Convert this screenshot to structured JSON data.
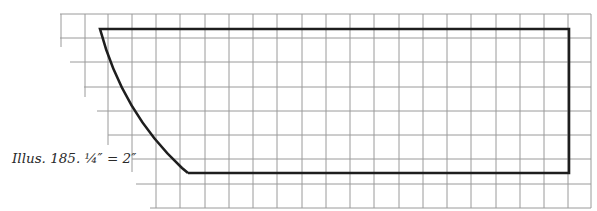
{
  "caption": {
    "text": "Illus. 185. ¼″ = 2″",
    "label": "Illus. 185.",
    "scale": "¼″ = 2″"
  },
  "grid": {
    "color": "#9a9a9a",
    "cell_px": 24.3,
    "right_x": 591,
    "bottom_y": 208,
    "rows": [
      {
        "y": 14,
        "start_x": 60
      },
      {
        "y": 38,
        "start_x": 60
      },
      {
        "y": 62,
        "start_x": 70
      },
      {
        "y": 87,
        "start_x": 84
      },
      {
        "y": 111,
        "start_x": 97
      },
      {
        "y": 135,
        "start_x": 108
      },
      {
        "y": 159,
        "start_x": 132
      },
      {
        "y": 184,
        "start_x": 136
      },
      {
        "y": 208,
        "start_x": 150
      }
    ],
    "columns": [
      {
        "x": 61,
        "end_y": 47
      },
      {
        "x": 85,
        "end_y": 97
      },
      {
        "x": 108,
        "end_y": 145
      },
      {
        "x": 132,
        "end_y": 172
      },
      {
        "x": 156,
        "end_y": 208
      }
    ],
    "column_spacing": 24.26,
    "full_columns_from_x": 156
  },
  "shape": {
    "stroke": "#1e1e1e",
    "stroke_width": 2.6,
    "top_left": [
      100,
      29
    ],
    "top_right": [
      569,
      29
    ],
    "bottom_right": [
      569,
      173
    ],
    "bottom_left": [
      188,
      173
    ],
    "curve_control": [
      122,
      112
    ]
  }
}
